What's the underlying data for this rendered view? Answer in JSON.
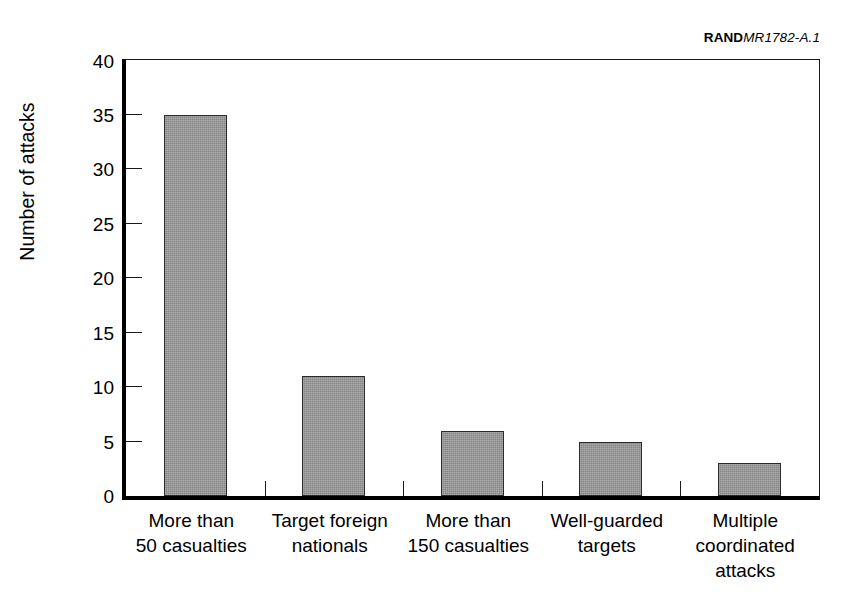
{
  "header": {
    "rand_mark": "RAND",
    "doc_number": "MR1782-A.1"
  },
  "chart_data": {
    "type": "bar",
    "title": "",
    "xlabel": "",
    "ylabel": "Number of attacks",
    "ylim": [
      0,
      40
    ],
    "ytick_step": 5,
    "grid": false,
    "legend": false,
    "bar_fill_color": "#878787",
    "bar_border_color": "#2b2b2b",
    "axis_color": "#000000",
    "background_color": "#ffffff",
    "categories": [
      "More than 50 casualties",
      "Target foreign nationals",
      "More than 150 casualties",
      "Well-guarded targets",
      "Multiple coordinated attacks"
    ],
    "category_label_lines": [
      [
        "More than",
        "50 casualties"
      ],
      [
        "Target foreign",
        "nationals"
      ],
      [
        "More than",
        "150 casualties"
      ],
      [
        "Well-guarded",
        "targets"
      ],
      [
        "Multiple",
        "coordinated",
        "attacks"
      ]
    ],
    "values": [
      35,
      11,
      6,
      5,
      3
    ],
    "ytick_labels": [
      "0",
      "5",
      "10",
      "15",
      "20",
      "25",
      "30",
      "35",
      "40"
    ],
    "ytick_values": [
      0,
      5,
      10,
      15,
      20,
      25,
      30,
      35,
      40
    ]
  }
}
